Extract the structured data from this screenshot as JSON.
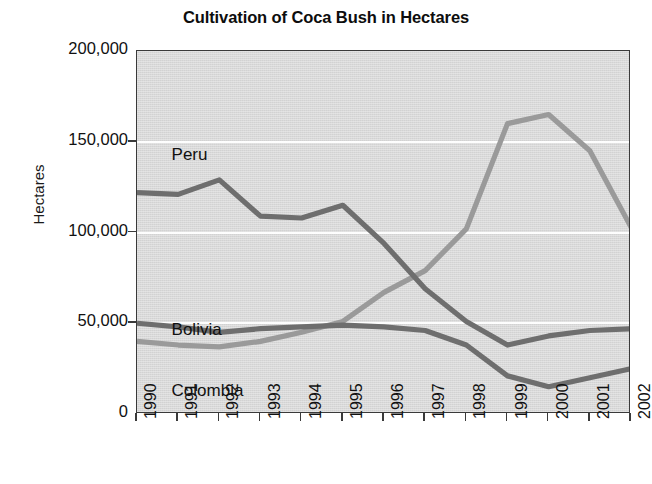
{
  "chart_data": {
    "type": "line",
    "title": "Cultivation of Coca Bush in Hectares",
    "xlabel": "",
    "ylabel": "Hectares",
    "categories": [
      "1990",
      "1991",
      "1992",
      "1993",
      "1994",
      "1995",
      "1996",
      "1997",
      "1998",
      "1999",
      "2000",
      "2001",
      "2002"
    ],
    "ylim": [
      0,
      200000
    ],
    "ytick_labels": [
      "0",
      "50,000",
      "100,000",
      "150,000",
      "200,000"
    ],
    "ytick_values": [
      0,
      50000,
      100000,
      150000,
      200000
    ],
    "grid": "horizontal-white-gridlines",
    "legend": "inline-labels-on-plot",
    "series": [
      {
        "name": "Peru",
        "color": "#6e6e6e",
        "label_x_pct": 7,
        "label_y_pct": 26,
        "values": [
          122000,
          121000,
          129000,
          109000,
          108000,
          115000,
          94000,
          69000,
          51000,
          38000,
          43000,
          46000,
          47000
        ]
      },
      {
        "name": "Bolivia",
        "color": "#6e6e6e",
        "label_x_pct": 7,
        "label_y_pct": 74,
        "values": [
          50000,
          48000,
          45000,
          47000,
          48000,
          49000,
          48000,
          46000,
          38000,
          21000,
          15000,
          20000,
          25000
        ]
      },
      {
        "name": "Colombia",
        "color": "#9a9a9a",
        "label_x_pct": 7,
        "label_y_pct": 91,
        "values": [
          40000,
          38000,
          37000,
          40000,
          45000,
          51000,
          67000,
          79000,
          102000,
          160000,
          165000,
          145000,
          103000
        ]
      }
    ],
    "annotations": [
      "Peru declines steeply after 1995",
      "Colombia rises sharply 1996-2000 then falls",
      "Bolivia stays near 50,000 until 1998 then drops"
    ]
  },
  "style": {
    "plot_background": "#d2d2d2",
    "gridline_color": "#fdfdfd",
    "axis_color": "#3a3a3a",
    "page_background": "#ffffff",
    "text_color": "#111111"
  }
}
